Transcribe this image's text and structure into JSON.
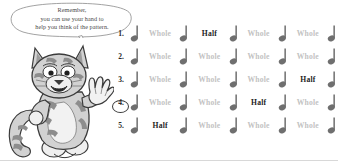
{
  "page": {
    "background_color": "#ffffff",
    "width": 338,
    "height": 161
  },
  "speech_bubble": {
    "name": "remember-speech-bubble",
    "line1": "Remember,",
    "line2": "you can use your hand to",
    "line3": "help you think of the pattern.",
    "text_color": "#4a4a4a",
    "outline_color": "#8a8a8a"
  },
  "mascot": {
    "name": "striped-cat-mascot",
    "description": "cartoon striped tiger cat waving one hand",
    "fur_color": "#cfcfcf",
    "stripe_color": "#8d8d8d",
    "outline_color": "#3b3b3b"
  },
  "legend": {
    "whole_label": "Whole",
    "half_label": "Half",
    "whole_color": "#c2c2c2",
    "half_color": "#1d1d1d",
    "note_icon": "quarter-note-icon"
  },
  "exercises": [
    {
      "number": "1.",
      "circled": false,
      "cells": [
        "Whole",
        "Half",
        "Whole",
        "Whole"
      ],
      "answer_index": 1
    },
    {
      "number": "2.",
      "circled": false,
      "cells": [
        "Whole",
        "Whole",
        "Whole",
        "Whole"
      ],
      "answer_index": -1
    },
    {
      "number": "3.",
      "circled": false,
      "cells": [
        "Whole",
        "Whole",
        "Whole",
        "Half"
      ],
      "answer_index": 3
    },
    {
      "number": "4.",
      "circled": true,
      "cells": [
        "Whole",
        "Whole",
        "Half",
        "Whole"
      ],
      "answer_index": 2
    },
    {
      "number": "5.",
      "circled": false,
      "cells": [
        "Half",
        "Whole",
        "Whole",
        "Whole"
      ],
      "answer_index": 0
    }
  ]
}
